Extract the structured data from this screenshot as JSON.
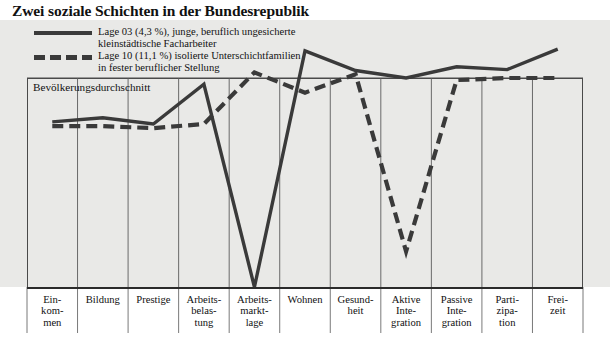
{
  "title": "Zwei soziale Schichten in der Bundesrepublik",
  "reference_line_label": "Bevölkerungsdurchschnitt",
  "legend": [
    {
      "style": "solid",
      "line1": "Lage 03 (4,3 %), junge, beruflich ungesicherte",
      "line2": "kleinstädtische Facharbeiter"
    },
    {
      "style": "dashed",
      "line1": "Lage 10 (11,1 %) isolierte Unterschichtfamilien",
      "line2": "in fester beruflicher Stellung"
    }
  ],
  "categories": [
    "Ein-\nkom-\nmen",
    "Bildung",
    "Prestige",
    "Arbeits-\nbelas-\ntung",
    "Arbeits-\nmarkt-\nlage",
    "Wohnen",
    "Gesund-\nheit",
    "Aktive\nInte-\ngration",
    "Passive\nInte-\ngration",
    "Parti-\nzipa-\ntion",
    "Frei-\nzeit"
  ],
  "colors": {
    "line": "#3a3a3a",
    "plot_background": "#e9e9e7",
    "grid": "#6a6a6a",
    "axis": "#2b2b2b",
    "text": "#111111"
  },
  "chart_data": {
    "type": "line",
    "title": "Zwei soziale Schichten in der Bundesrepublik",
    "xlabel": "",
    "ylabel": "",
    "grid": true,
    "legend_position": "top-left",
    "annotations": [
      "Bevölkerungsdurchschnitt"
    ],
    "note": "Values are relative deviations from the population average (reference line = 0). Positive = above average.",
    "ylim": [
      -100,
      60
    ],
    "categories": [
      "Einkommen",
      "Bildung",
      "Prestige",
      "Arbeitsbelastung",
      "Arbeitsmarktlage",
      "Wohnen",
      "Gesundheit",
      "Aktive Integration",
      "Passive Integration",
      "Partizipation",
      "Freizeit"
    ],
    "series": [
      {
        "name": "Lage 03 (4,3 %), junge, beruflich ungesicherte kleinstädtische Facharbeiter",
        "style": "solid",
        "values": [
          -21,
          -19,
          -22,
          -3,
          -100,
          29,
          8,
          0,
          12,
          9,
          31
        ]
      },
      {
        "name": "Lage 10 (11,1 %) isolierte Unterschichtfamilien in fester beruflicher Stellung",
        "style": "dashed",
        "values": [
          -23,
          -23,
          -24,
          -22,
          6,
          -7,
          4,
          -83,
          -1,
          0,
          0
        ]
      }
    ]
  }
}
